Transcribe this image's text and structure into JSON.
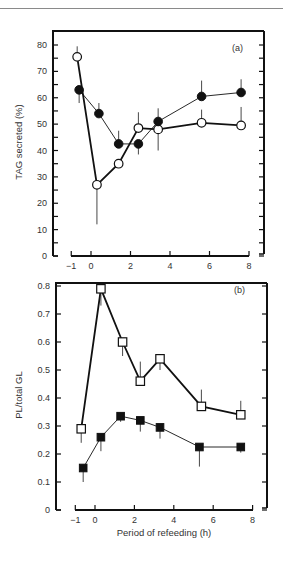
{
  "chart_data": [
    {
      "type": "line",
      "panel_label": "(a)",
      "title": "",
      "xlabel": "",
      "ylabel": "TAG secreted (%)",
      "xlim": [
        -1,
        8
      ],
      "ylim": [
        0,
        80
      ],
      "xticks": [
        -1,
        0,
        2,
        4,
        6,
        8
      ],
      "yticks": [
        0,
        10,
        20,
        30,
        40,
        50,
        60,
        70,
        80
      ],
      "grid": false,
      "series": [
        {
          "name": "open circles",
          "marker": "open-circle",
          "line": "thick",
          "x": [
            -0.7,
            0.3,
            1.4,
            2.4,
            3.4,
            5.6,
            7.6
          ],
          "values": [
            75.5,
            27,
            35,
            48.5,
            48,
            50.5,
            49.5
          ],
          "error_up": [
            4,
            0,
            0,
            6,
            0,
            5,
            7
          ],
          "error_down": [
            0,
            15,
            0,
            0,
            8,
            0,
            0
          ]
        },
        {
          "name": "filled circles",
          "marker": "filled-circle",
          "line": "thin",
          "x": [
            -0.6,
            0.4,
            1.4,
            2.4,
            3.4,
            5.6,
            7.6
          ],
          "values": [
            63,
            54,
            42.5,
            42.5,
            51,
            60.5,
            62
          ],
          "error_up": [
            0,
            4,
            5,
            0,
            5,
            6,
            5
          ],
          "error_down": [
            5,
            0,
            0,
            4,
            0,
            0,
            0
          ]
        }
      ]
    },
    {
      "type": "line",
      "panel_label": "(b)",
      "title": "",
      "xlabel": "Period of refeeding (h)",
      "ylabel": "PL/total GL",
      "xlim": [
        -1,
        8
      ],
      "ylim": [
        0,
        0.8
      ],
      "xticks": [
        -1,
        0,
        2,
        4,
        6,
        8
      ],
      "yticks": [
        0,
        0.1,
        0.2,
        0.3,
        0.4,
        0.5,
        0.6,
        0.7,
        0.8
      ],
      "grid": false,
      "series": [
        {
          "name": "open squares",
          "marker": "open-square",
          "line": "thick",
          "x": [
            -0.7,
            0.3,
            1.4,
            2.3,
            3.3,
            5.4,
            7.4
          ],
          "values": [
            0.29,
            0.79,
            0.6,
            0.46,
            0.54,
            0.37,
            0.34
          ],
          "error_up": [
            0,
            0,
            0,
            0.07,
            0,
            0.06,
            0.05
          ],
          "error_down": [
            0.05,
            0.06,
            0.05,
            0,
            0.04,
            0,
            0
          ]
        },
        {
          "name": "filled squares",
          "marker": "filled-square",
          "line": "thin",
          "x": [
            -0.6,
            0.3,
            1.3,
            2.3,
            3.3,
            5.3,
            7.4
          ],
          "values": [
            0.15,
            0.26,
            0.335,
            0.32,
            0.295,
            0.225,
            0.225
          ],
          "error_up": [
            0,
            0,
            0,
            0,
            0,
            0,
            0
          ],
          "error_down": [
            0.05,
            0.05,
            0.02,
            0.04,
            0.04,
            0.07,
            0.02
          ]
        }
      ]
    }
  ],
  "labels": {
    "panel_a": "(a)",
    "panel_b": "(b)",
    "ylabel_a": "TAG secreted (%)",
    "ylabel_b": "PL/total GL",
    "xlabel": "Period of refeeding (h)"
  }
}
